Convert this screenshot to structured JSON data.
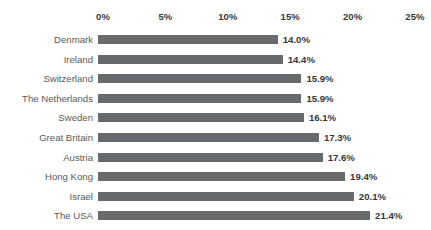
{
  "chart_data": {
    "type": "bar",
    "orientation": "horizontal",
    "title": "",
    "subtitle": "",
    "xlabel": "",
    "ylabel": "",
    "xlim": [
      0,
      25
    ],
    "grid": false,
    "legend": null,
    "value_label_suffix": "%",
    "categories": [
      "Denmark",
      "Ireland",
      "Switzerland",
      "The Netherlands",
      "Sweden",
      "Great Britain",
      "Austria",
      "Hong Kong",
      "Israel",
      "The USA"
    ],
    "values": [
      14.0,
      14.4,
      15.9,
      15.9,
      16.1,
      17.3,
      17.6,
      19.4,
      20.1,
      21.4
    ],
    "value_labels": [
      "14.0%",
      "14.4%",
      "15.9%",
      "15.9%",
      "16.1%",
      "17.3%",
      "17.6%",
      "19.4%",
      "20.1%",
      "21.4%"
    ],
    "xticks": [
      0,
      5,
      10,
      15,
      20,
      25
    ],
    "xtick_labels": [
      "0%",
      "5%",
      "10%",
      "15%",
      "20%",
      "25%"
    ],
    "colors": {
      "bar": "#666a6c",
      "value_label": "#33383b",
      "category_label": "#555b5e",
      "tick_label": "#333a3d",
      "background": "#ffffff"
    }
  },
  "caption": {
    "clipped_text": ""
  }
}
